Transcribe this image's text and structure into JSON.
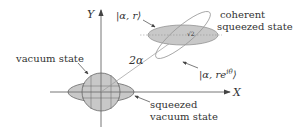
{
  "diagram": {
    "axes": {
      "x_label": "X",
      "y_label": "Y"
    },
    "labels": {
      "vacuum_state": "vacuum state",
      "squeezed_vacuum_line1": "squeezed",
      "squeezed_vacuum_line2": "vacuum state",
      "coherent_line1": "coherent",
      "coherent_line2": "squeezed state",
      "ket_alpha_r": "|α, r⟩",
      "ket_alpha_re_prefix": "|α, re",
      "ket_alpha_re_exp": "iθ",
      "ket_close": "⟩",
      "displacement": "2α",
      "sqrt2": "√2"
    },
    "colors": {
      "fill": "#c8c8c8",
      "stroke": "#555555",
      "outline": "#999999",
      "text": "#333333"
    }
  }
}
